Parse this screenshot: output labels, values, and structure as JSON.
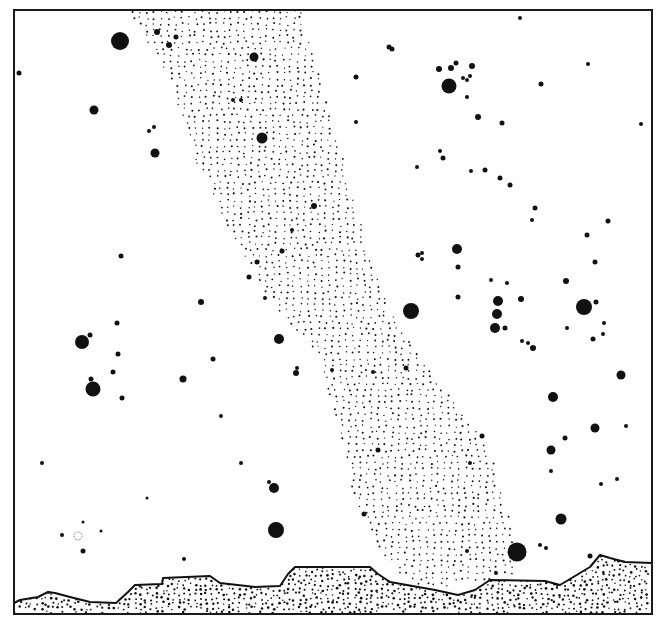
{
  "figure": {
    "frame": {
      "x": 14,
      "y": 10,
      "w": 638,
      "h": 604,
      "stroke": "#1a1a1a"
    },
    "ink": "#111111",
    "background": "#ffffff"
  },
  "milky_way": {
    "polygon": [
      [
        128,
        10
      ],
      [
        300,
        10
      ],
      [
        330,
        110
      ],
      [
        355,
        200
      ],
      [
        370,
        260
      ],
      [
        400,
        330
      ],
      [
        445,
        390
      ],
      [
        490,
        450
      ],
      [
        510,
        520
      ],
      [
        515,
        575
      ],
      [
        420,
        590
      ],
      [
        385,
        560
      ],
      [
        355,
        500
      ],
      [
        340,
        430
      ],
      [
        320,
        360
      ],
      [
        270,
        300
      ],
      [
        230,
        230
      ],
      [
        195,
        160
      ],
      [
        170,
        80
      ]
    ],
    "dot_spacing": 7,
    "dot_radius": 0.9
  },
  "stars": [
    {
      "x": 120,
      "y": 41,
      "r": 9
    },
    {
      "x": 157,
      "y": 32,
      "r": 3
    },
    {
      "x": 176,
      "y": 37,
      "r": 2.5
    },
    {
      "x": 169,
      "y": 45,
      "r": 3
    },
    {
      "x": 254,
      "y": 57,
      "r": 4.5
    },
    {
      "x": 19,
      "y": 73,
      "r": 2.5
    },
    {
      "x": 94,
      "y": 110,
      "r": 4.5
    },
    {
      "x": 155,
      "y": 153,
      "r": 4.5
    },
    {
      "x": 149,
      "y": 131,
      "r": 2
    },
    {
      "x": 154,
      "y": 127,
      "r": 2
    },
    {
      "x": 262,
      "y": 138,
      "r": 5.5
    },
    {
      "x": 233,
      "y": 100,
      "r": 2
    },
    {
      "x": 241,
      "y": 100,
      "r": 2
    },
    {
      "x": 520,
      "y": 18,
      "r": 2
    },
    {
      "x": 389,
      "y": 47,
      "r": 2.5
    },
    {
      "x": 392,
      "y": 49,
      "r": 2.5
    },
    {
      "x": 356,
      "y": 77,
      "r": 2.5
    },
    {
      "x": 439,
      "y": 69,
      "r": 3
    },
    {
      "x": 451,
      "y": 68,
      "r": 3
    },
    {
      "x": 456,
      "y": 63,
      "r": 2.5
    },
    {
      "x": 472,
      "y": 66,
      "r": 3
    },
    {
      "x": 449,
      "y": 86,
      "r": 7.5
    },
    {
      "x": 463,
      "y": 78,
      "r": 2
    },
    {
      "x": 470,
      "y": 76,
      "r": 2
    },
    {
      "x": 467,
      "y": 80,
      "r": 2
    },
    {
      "x": 467,
      "y": 97,
      "r": 2
    },
    {
      "x": 541,
      "y": 84,
      "r": 2.5
    },
    {
      "x": 588,
      "y": 64,
      "r": 2
    },
    {
      "x": 478,
      "y": 117,
      "r": 3
    },
    {
      "x": 502,
      "y": 123,
      "r": 2.5
    },
    {
      "x": 641,
      "y": 124,
      "r": 2
    },
    {
      "x": 356,
      "y": 122,
      "r": 2
    },
    {
      "x": 440,
      "y": 151,
      "r": 2
    },
    {
      "x": 443,
      "y": 158,
      "r": 2.5
    },
    {
      "x": 417,
      "y": 167,
      "r": 2
    },
    {
      "x": 471,
      "y": 171,
      "r": 2
    },
    {
      "x": 485,
      "y": 170,
      "r": 2.5
    },
    {
      "x": 500,
      "y": 178,
      "r": 2.5
    },
    {
      "x": 510,
      "y": 185,
      "r": 2.5
    },
    {
      "x": 535,
      "y": 208,
      "r": 2.5
    },
    {
      "x": 532,
      "y": 220,
      "r": 2
    },
    {
      "x": 608,
      "y": 221,
      "r": 2.5
    },
    {
      "x": 587,
      "y": 235,
      "r": 2.5
    },
    {
      "x": 457,
      "y": 249,
      "r": 5
    },
    {
      "x": 458,
      "y": 267,
      "r": 2.5
    },
    {
      "x": 418,
      "y": 255,
      "r": 2.5
    },
    {
      "x": 422,
      "y": 253,
      "r": 2
    },
    {
      "x": 422,
      "y": 259,
      "r": 2
    },
    {
      "x": 595,
      "y": 262,
      "r": 2.5
    },
    {
      "x": 566,
      "y": 281,
      "r": 3
    },
    {
      "x": 491,
      "y": 280,
      "r": 2
    },
    {
      "x": 507,
      "y": 283,
      "r": 2
    },
    {
      "x": 411,
      "y": 311,
      "r": 8
    },
    {
      "x": 458,
      "y": 297,
      "r": 2.5
    },
    {
      "x": 498,
      "y": 301,
      "r": 5
    },
    {
      "x": 521,
      "y": 299,
      "r": 3
    },
    {
      "x": 497,
      "y": 314,
      "r": 5
    },
    {
      "x": 495,
      "y": 328,
      "r": 5
    },
    {
      "x": 505,
      "y": 328,
      "r": 2.5
    },
    {
      "x": 567,
      "y": 328,
      "r": 2
    },
    {
      "x": 584,
      "y": 307,
      "r": 8
    },
    {
      "x": 596,
      "y": 302,
      "r": 2.5
    },
    {
      "x": 604,
      "y": 323,
      "r": 2
    },
    {
      "x": 603,
      "y": 334,
      "r": 2
    },
    {
      "x": 593,
      "y": 339,
      "r": 2.5
    },
    {
      "x": 522,
      "y": 341,
      "r": 2
    },
    {
      "x": 528,
      "y": 343,
      "r": 2
    },
    {
      "x": 533,
      "y": 348,
      "r": 3
    },
    {
      "x": 621,
      "y": 375,
      "r": 4.5
    },
    {
      "x": 121,
      "y": 256,
      "r": 2.5
    },
    {
      "x": 201,
      "y": 302,
      "r": 3
    },
    {
      "x": 117,
      "y": 323,
      "r": 2.5
    },
    {
      "x": 82,
      "y": 342,
      "r": 7
    },
    {
      "x": 90,
      "y": 335,
      "r": 2.5
    },
    {
      "x": 118,
      "y": 354,
      "r": 2.5
    },
    {
      "x": 113,
      "y": 372,
      "r": 2.5
    },
    {
      "x": 93,
      "y": 389,
      "r": 7.5
    },
    {
      "x": 91,
      "y": 379,
      "r": 2.5
    },
    {
      "x": 122,
      "y": 398,
      "r": 2.5
    },
    {
      "x": 183,
      "y": 379,
      "r": 3.5
    },
    {
      "x": 213,
      "y": 359,
      "r": 2.5
    },
    {
      "x": 279,
      "y": 339,
      "r": 5
    },
    {
      "x": 296,
      "y": 373,
      "r": 3
    },
    {
      "x": 297,
      "y": 368,
      "r": 2
    },
    {
      "x": 221,
      "y": 416,
      "r": 2
    },
    {
      "x": 314,
      "y": 206,
      "r": 3
    },
    {
      "x": 292,
      "y": 230,
      "r": 2
    },
    {
      "x": 282,
      "y": 251,
      "r": 2.5
    },
    {
      "x": 257,
      "y": 262,
      "r": 2.5
    },
    {
      "x": 249,
      "y": 277,
      "r": 2.5
    },
    {
      "x": 265,
      "y": 298,
      "r": 2
    },
    {
      "x": 373,
      "y": 372,
      "r": 2
    },
    {
      "x": 406,
      "y": 368,
      "r": 2.5
    },
    {
      "x": 332,
      "y": 370,
      "r": 2
    },
    {
      "x": 553,
      "y": 397,
      "r": 5
    },
    {
      "x": 595,
      "y": 428,
      "r": 4.5
    },
    {
      "x": 626,
      "y": 426,
      "r": 2
    },
    {
      "x": 565,
      "y": 438,
      "r": 2.5
    },
    {
      "x": 551,
      "y": 450,
      "r": 4.5
    },
    {
      "x": 551,
      "y": 471,
      "r": 2
    },
    {
      "x": 601,
      "y": 484,
      "r": 2
    },
    {
      "x": 617,
      "y": 479,
      "r": 2
    },
    {
      "x": 378,
      "y": 450,
      "r": 2.5
    },
    {
      "x": 482,
      "y": 436,
      "r": 2.5
    },
    {
      "x": 470,
      "y": 463,
      "r": 2
    },
    {
      "x": 42,
      "y": 463,
      "r": 2
    },
    {
      "x": 241,
      "y": 463,
      "r": 2
    },
    {
      "x": 274,
      "y": 488,
      "r": 5
    },
    {
      "x": 269,
      "y": 482,
      "r": 2
    },
    {
      "x": 147,
      "y": 498,
      "r": 1.5
    },
    {
      "x": 364,
      "y": 514,
      "r": 2.5
    },
    {
      "x": 561,
      "y": 519,
      "r": 5.5
    },
    {
      "x": 276,
      "y": 530,
      "r": 8
    },
    {
      "x": 83,
      "y": 522,
      "r": 1.5
    },
    {
      "x": 62,
      "y": 535,
      "r": 2
    },
    {
      "x": 101,
      "y": 531,
      "r": 1.5
    },
    {
      "x": 83,
      "y": 551,
      "r": 2.5
    },
    {
      "x": 184,
      "y": 559,
      "r": 2
    },
    {
      "x": 517,
      "y": 552,
      "r": 9.5
    },
    {
      "x": 540,
      "y": 545,
      "r": 2
    },
    {
      "x": 546,
      "y": 548,
      "r": 2
    },
    {
      "x": 590,
      "y": 556,
      "r": 2.5
    },
    {
      "x": 467,
      "y": 551,
      "r": 2
    },
    {
      "x": 496,
      "y": 573,
      "r": 2
    }
  ],
  "nebula": {
    "x": 78,
    "y": 536,
    "r": 4
  },
  "horizon": {
    "ridge": [
      [
        14,
        603
      ],
      [
        20,
        600
      ],
      [
        38,
        597
      ],
      [
        48,
        592
      ],
      [
        55,
        593
      ],
      [
        70,
        597
      ],
      [
        90,
        602
      ],
      [
        116,
        603
      ],
      [
        128,
        592
      ],
      [
        135,
        585
      ],
      [
        162,
        584
      ],
      [
        163,
        578
      ],
      [
        210,
        576
      ],
      [
        220,
        583
      ],
      [
        255,
        587
      ],
      [
        280,
        586
      ],
      [
        288,
        574
      ],
      [
        295,
        567
      ],
      [
        370,
        567
      ],
      [
        378,
        574
      ],
      [
        390,
        582
      ],
      [
        435,
        590
      ],
      [
        458,
        595
      ],
      [
        475,
        590
      ],
      [
        490,
        580
      ],
      [
        545,
        581
      ],
      [
        560,
        585
      ],
      [
        575,
        576
      ],
      [
        590,
        567
      ],
      [
        600,
        555
      ],
      [
        610,
        558
      ],
      [
        625,
        562
      ],
      [
        652,
        563
      ]
    ],
    "bottom": 614,
    "dot_spacing": 5.5,
    "dot_radius": 1.05
  }
}
